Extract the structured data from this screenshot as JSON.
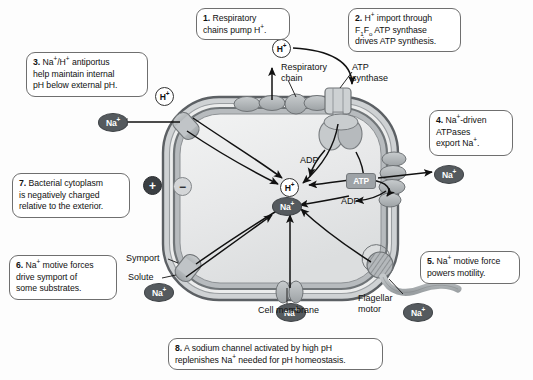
{
  "figure": {
    "type": "biology-diagram"
  },
  "callouts": [
    {
      "id": 1,
      "num": "1.",
      "html": "Respiratory<br>chains pump H<sup>+</sup>."
    },
    {
      "id": 2,
      "num": "2.",
      "html": "H<sup>+</sup> import through<br>F<sub>1</sub>F<sub>o</sub> ATP synthase<br>drives ATP synthesis."
    },
    {
      "id": 3,
      "num": "3.",
      "html": "Na<sup>+</sup>/H<sup>+</sup> antiportus<br>help maintain internal<br>pH below external pH."
    },
    {
      "id": 4,
      "num": "4.",
      "html": "Na<sup>+</sup>-driven<br>ATPases<br>export Na<sup>+</sup>."
    },
    {
      "id": 5,
      "num": "5.",
      "html": "Na<sup>+</sup> motive force<br>powers motility."
    },
    {
      "id": 6,
      "num": "6.",
      "html": "Na<sup>+</sup> motive forces<br>drive symport of<br>some substrates."
    },
    {
      "id": 7,
      "num": "7.",
      "html": "Bacterial cytoplasm<br>is negatively charged<br>relative to the exterior."
    },
    {
      "id": 8,
      "num": "8.",
      "html": "A sodium channel activated by high pH<br>replenishes Na<sup>+</sup> needed for pH homeostasis."
    }
  ],
  "labels": {
    "respiratory_chain": "Respiratory<br>chain",
    "atp_synthase": "ATP<br>synthase",
    "cell_membrane": "Cell membrane",
    "flagellar_motor": "Flagellar<br>motor",
    "symport": "Symport",
    "solute": "Solute",
    "adp_left": "ADP",
    "adp_right": "ADP"
  },
  "ions": {
    "na": "Na<sup>+</sup>",
    "h": "H<sup>+</sup>",
    "atp": "ATP"
  },
  "charges": {
    "exterior": "+",
    "interior": "−"
  },
  "colors": {
    "membrane_outer": "#6f7478",
    "membrane_band": "#b9bdc0",
    "cytoplasm": "#e9eaeb",
    "protein": "#b0b4b7",
    "na_badge": "#555a5e",
    "atp_badge": "#9ea3a7",
    "callout_border": "#6f6f6f",
    "text": "#111111"
  }
}
